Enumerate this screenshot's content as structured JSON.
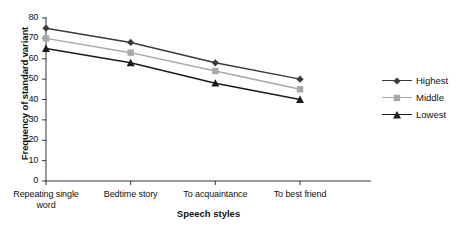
{
  "chart_data": {
    "type": "line",
    "title": "",
    "xlabel": "Speech styles",
    "ylabel": "Frequency of standard variant",
    "categories": [
      "Repeating single word",
      "Bedtime story",
      "To acquaintance",
      "To best friend"
    ],
    "category_lines": [
      [
        "Repeating single",
        "word"
      ],
      [
        "Bedtime story"
      ],
      [
        "To acquaintance"
      ],
      [
        "To best friend"
      ]
    ],
    "series": [
      {
        "name": "Highest",
        "values": [
          75,
          68,
          58,
          50
        ],
        "color": "#3a3a3a",
        "marker": "diamond"
      },
      {
        "name": "Middle",
        "values": [
          70,
          63,
          54,
          45
        ],
        "color": "#a8a8a8",
        "marker": "square"
      },
      {
        "name": "Lowest",
        "values": [
          65,
          58,
          48,
          40
        ],
        "color": "#1a1a1a",
        "marker": "triangle"
      }
    ],
    "ylim": [
      0,
      80
    ],
    "yticks": [
      0,
      10,
      20,
      30,
      40,
      50,
      60,
      70,
      80
    ],
    "ytick_labels": [
      "0",
      "10",
      "20",
      "30",
      "40",
      "50",
      "60",
      "70",
      "80"
    ],
    "grid": false,
    "legend_position": "right"
  }
}
